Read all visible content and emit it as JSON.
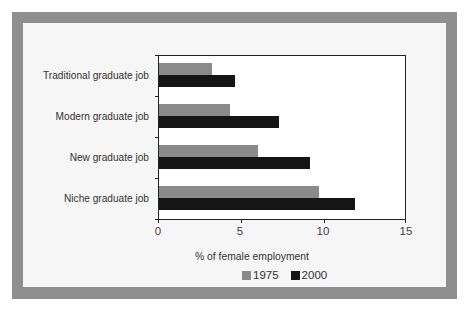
{
  "chart_data": {
    "type": "bar",
    "orientation": "horizontal",
    "title": "",
    "xlabel": "% of female employment",
    "ylabel": "",
    "xlim": [
      0,
      15
    ],
    "xticks": [
      0,
      5,
      10,
      15
    ],
    "grid": false,
    "legend_position": "bottom",
    "categories": [
      "Traditional graduate job",
      "Modern graduate job",
      "New graduate job",
      "Niche graduate job"
    ],
    "series": [
      {
        "name": "1975",
        "color": "#8a8a8a",
        "values": [
          3.2,
          4.3,
          6.0,
          9.7
        ]
      },
      {
        "name": "2000",
        "color": "#151515",
        "values": [
          4.6,
          7.3,
          9.2,
          11.9
        ]
      }
    ]
  },
  "labels": {
    "cat0": "Traditional graduate job",
    "cat1": "Modern graduate job",
    "cat2": "New graduate job",
    "cat3": "Niche graduate job",
    "x0": "0",
    "x1": "5",
    "x2": "10",
    "x3": "15",
    "xaxis_title": "% of female employment",
    "legend_1975": "1975",
    "legend_2000": "2000"
  },
  "colors": {
    "frame": "#8f8f8f",
    "panel": "#f6f6f6",
    "series_1975": "#8a8a8a",
    "series_2000": "#151515"
  }
}
